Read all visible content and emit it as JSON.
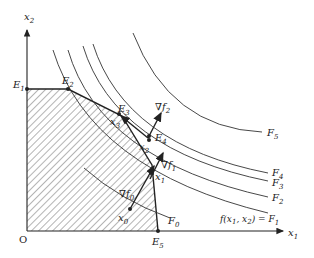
{
  "figure": {
    "type": "linear-programming feasible region with objective contours",
    "axes": {
      "x_label": "x",
      "x_sub": "1",
      "y_label": "x",
      "y_sub": "2",
      "origin_label": "O"
    },
    "vertices": [
      {
        "name": "E",
        "sub": "1"
      },
      {
        "name": "E",
        "sub": "2"
      },
      {
        "name": "E",
        "sub": "3"
      },
      {
        "name": "E",
        "sub": "4"
      },
      {
        "name": "E",
        "sub": "5"
      }
    ],
    "iterates": [
      {
        "name": "x",
        "sub": "0"
      },
      {
        "name": "x",
        "sub": "1"
      },
      {
        "name": "x",
        "sub": "2"
      },
      {
        "name": "x",
        "sub": "3"
      }
    ],
    "gradients": [
      {
        "name": "∇f",
        "sub": "0"
      },
      {
        "name": "∇f",
        "sub": "1"
      },
      {
        "name": "∇f",
        "sub": "2"
      }
    ],
    "contours": [
      {
        "name": "F",
        "sub": "0"
      },
      {
        "name": "F",
        "sub": "1",
        "prefix": "f(x",
        "mid": ", x",
        "suffix": ") = F"
      },
      {
        "name": "F",
        "sub": "2"
      },
      {
        "name": "F",
        "sub": "3"
      },
      {
        "name": "F",
        "sub": "4"
      },
      {
        "name": "F",
        "sub": "5"
      }
    ],
    "colors": {
      "ink": "#222222",
      "background": "#ffffff"
    }
  }
}
